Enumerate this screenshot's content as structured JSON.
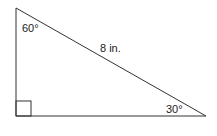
{
  "diagram": {
    "type": "right-triangle",
    "angles": {
      "top": "60°",
      "bottom_right": "30°",
      "bottom_left": "right-angle"
    },
    "hypotenuse_label": "8 in.",
    "stroke_color": "#333333"
  }
}
